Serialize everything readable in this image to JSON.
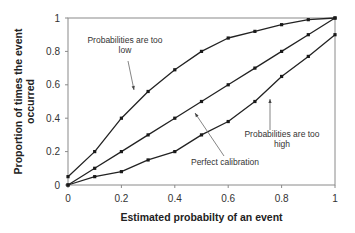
{
  "chart_data": {
    "type": "line",
    "title": "",
    "xlabel": "Estimated probabilty of an event",
    "ylabel": [
      "Proportion of times the event",
      "occurred"
    ],
    "xlim": [
      0,
      1
    ],
    "ylim": [
      0,
      1
    ],
    "grid": false,
    "legend": null,
    "x_ticks": [
      "0",
      "0.2",
      "0.4",
      "0.6",
      "0.8",
      "1"
    ],
    "y_ticks": [
      "0",
      "0.2",
      "0.4",
      "0.6",
      "0.8",
      "1"
    ],
    "x": [
      0,
      0.1,
      0.2,
      0.3,
      0.4,
      0.5,
      0.6,
      0.7,
      0.8,
      0.9,
      1.0
    ],
    "series": [
      {
        "name": "Probabilities are too low",
        "values": [
          0.05,
          0.2,
          0.4,
          0.56,
          0.69,
          0.8,
          0.88,
          0.92,
          0.96,
          0.99,
          1.0
        ]
      },
      {
        "name": "Perfect calibration",
        "values": [
          0.0,
          0.1,
          0.2,
          0.3,
          0.4,
          0.5,
          0.6,
          0.7,
          0.8,
          0.9,
          1.0
        ]
      },
      {
        "name": "Probabilities are too high",
        "values": [
          0.0,
          0.05,
          0.08,
          0.15,
          0.2,
          0.3,
          0.38,
          0.5,
          0.65,
          0.77,
          0.9
        ]
      }
    ],
    "annotations": [
      {
        "lines": [
          "Probabilities are too",
          "low"
        ],
        "target_series": "Probabilities are too low"
      },
      {
        "lines": [
          "Perfect calibration"
        ],
        "target_series": "Perfect calibration"
      },
      {
        "lines": [
          "Probabilities are too",
          "high"
        ],
        "target_series": "Probabilities are too high"
      }
    ],
    "colors": {
      "line": "#222222",
      "marker": "#1a1a1a",
      "axis": "#8a8a8a",
      "text": "#333333"
    }
  }
}
